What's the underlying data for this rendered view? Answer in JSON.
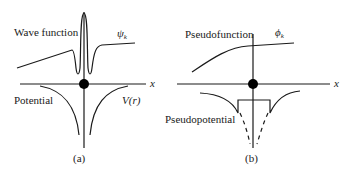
{
  "panel_a": {
    "caption": "(a)",
    "wave_label": "Wave function",
    "wave_symbol": "ψ",
    "wave_subscript": "k",
    "potential_label": "Potential",
    "potential_symbol": "V(r)",
    "axis_label": "x"
  },
  "panel_b": {
    "caption": "(b)",
    "wave_label": "Pseudofunction",
    "wave_symbol": "ϕ",
    "wave_subscript": "k",
    "potential_label": "Pseudopotential",
    "axis_label": "x"
  },
  "colors": {
    "ink": "#1a1a1a",
    "background": "#ffffff"
  }
}
